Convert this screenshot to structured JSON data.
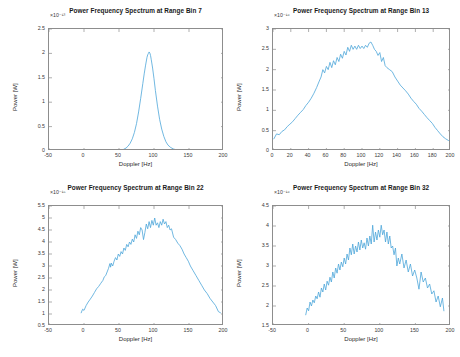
{
  "figure": {
    "background_color": "#ffffff",
    "line_color": "#4DA6D9",
    "axis_color": "#8d8d8d",
    "grid": false,
    "layout": "2x2 subplot grid"
  },
  "chart_data": [
    {
      "type": "line",
      "id": "range-bin-7",
      "title": "Power Frequency Spectrum at Range Bin 7",
      "xlabel": "Doppler [Hz]",
      "ylabel": "Power [W]",
      "exponent_label": "×10⁻¹³",
      "xlim": [
        -50,
        200
      ],
      "ylim": [
        0,
        2.5
      ],
      "xticks": [
        -50,
        0,
        50,
        100,
        150,
        200
      ],
      "xticklabels": [
        "-50",
        "0",
        "50",
        "100",
        "150",
        "200"
      ],
      "yticks": [
        0,
        0.5,
        1,
        1.5,
        2,
        2.5
      ],
      "yticklabels": [
        "0",
        "0.5",
        "1",
        "1.5",
        "2",
        "2.5"
      ],
      "legend": null,
      "series": [
        {
          "name": "spectrum",
          "color": "#4DA6D9",
          "x": [
            -48,
            -40,
            -30,
            -20,
            -10,
            0,
            10,
            20,
            30,
            40,
            48,
            52,
            56,
            60,
            63,
            66,
            69,
            72,
            75,
            78,
            81,
            84,
            86,
            88,
            90,
            91,
            92,
            93,
            94,
            95,
            96,
            98,
            100,
            102,
            105,
            108,
            111,
            114,
            117,
            120,
            124,
            128,
            133,
            138,
            145,
            152,
            160,
            170,
            180,
            190,
            198
          ],
          "y": [
            0.005,
            0.005,
            0.005,
            0.006,
            0.006,
            0.006,
            0.007,
            0.007,
            0.008,
            0.009,
            0.012,
            0.018,
            0.03,
            0.06,
            0.1,
            0.16,
            0.25,
            0.38,
            0.56,
            0.8,
            1.08,
            1.38,
            1.58,
            1.76,
            1.92,
            1.97,
            2.0,
            2.03,
            2.01,
            1.96,
            1.88,
            1.7,
            1.48,
            1.24,
            0.92,
            0.65,
            0.45,
            0.3,
            0.19,
            0.12,
            0.07,
            0.04,
            0.02,
            0.013,
            0.008,
            0.006,
            0.005,
            0.005,
            0.005,
            0.005,
            0.005
          ]
        }
      ]
    },
    {
      "type": "line",
      "id": "range-bin-13",
      "title": "Power Frequency Spectrum at Range Bin 13",
      "xlabel": "Doppler [Hz]",
      "ylabel": "Power [W]",
      "exponent_label": "×10⁻¹⁶",
      "xlim": [
        0,
        200
      ],
      "ylim": [
        0,
        3
      ],
      "xticks": [
        0,
        20,
        40,
        60,
        80,
        100,
        120,
        140,
        160,
        180,
        200
      ],
      "xticklabels": [
        "0",
        "20",
        "40",
        "60",
        "80",
        "100",
        "120",
        "140",
        "160",
        "180",
        "200"
      ],
      "yticks": [
        0,
        0.5,
        1,
        1.5,
        2,
        2.5,
        3
      ],
      "yticklabels": [
        "0",
        "0.5",
        "1",
        "1.5",
        "2",
        "2.5",
        "3"
      ],
      "legend": null,
      "series": [
        {
          "name": "spectrum",
          "color": "#4DA6D9",
          "x": [
            1,
            4,
            7,
            10,
            13,
            16,
            19,
            22,
            25,
            28,
            31,
            34,
            37,
            40,
            43,
            46,
            49,
            52,
            54,
            56,
            58,
            60,
            62,
            64,
            66,
            68,
            70,
            72,
            74,
            76,
            78,
            80,
            82,
            84,
            86,
            88,
            90,
            92,
            94,
            96,
            98,
            100,
            102,
            104,
            106,
            108,
            110,
            112,
            114,
            116,
            118,
            120,
            122,
            124,
            126,
            128,
            131,
            134,
            137,
            140,
            143,
            146,
            149,
            152,
            155,
            158,
            161,
            164,
            167,
            170,
            173,
            176,
            179,
            182,
            185,
            188,
            191,
            194,
            197,
            199
          ],
          "y": [
            0.3,
            0.42,
            0.4,
            0.48,
            0.52,
            0.6,
            0.66,
            0.72,
            0.8,
            0.88,
            0.95,
            1.02,
            1.12,
            1.2,
            1.3,
            1.42,
            1.56,
            1.72,
            1.82,
            2.0,
            1.92,
            2.08,
            2.0,
            2.18,
            2.05,
            2.22,
            2.12,
            2.3,
            2.2,
            2.38,
            2.28,
            2.45,
            2.36,
            2.55,
            2.45,
            2.6,
            2.5,
            2.58,
            2.5,
            2.6,
            2.52,
            2.58,
            2.52,
            2.6,
            2.55,
            2.65,
            2.68,
            2.6,
            2.5,
            2.45,
            2.35,
            2.42,
            2.2,
            2.3,
            2.1,
            2.05,
            2.0,
            1.95,
            1.82,
            1.72,
            1.62,
            1.55,
            1.48,
            1.4,
            1.3,
            1.22,
            1.15,
            1.05,
            0.98,
            0.9,
            0.82,
            0.75,
            0.68,
            0.58,
            0.5,
            0.42,
            0.35,
            0.3,
            0.26,
            0.24
          ]
        }
      ]
    },
    {
      "type": "line",
      "id": "range-bin-22",
      "title": "Power Frequency Spectrum at Range Bin 22",
      "xlabel": "Doppler [Hz]",
      "ylabel": "Power [W]",
      "exponent_label": "×10⁻¹⁵",
      "xlim": [
        -50,
        200
      ],
      "ylim": [
        0.5,
        5.5
      ],
      "xticks": [
        -50,
        0,
        50,
        100,
        150,
        200
      ],
      "xticklabels": [
        "-50",
        "0",
        "50",
        "100",
        "150",
        "200"
      ],
      "yticks": [
        0.5,
        1,
        1.5,
        2,
        2.5,
        3,
        3.5,
        4,
        4.5,
        5,
        5.5
      ],
      "yticklabels": [
        "0.5",
        "1",
        "1.5",
        "2",
        "2.5",
        "3",
        "3.5",
        "4",
        "4.5",
        "5",
        "5.5"
      ],
      "legend": null,
      "series": [
        {
          "name": "spectrum",
          "color": "#4DA6D9",
          "x": [
            -4,
            -2,
            0,
            3,
            6,
            9,
            12,
            15,
            18,
            21,
            24,
            27,
            29,
            31,
            33,
            35,
            37,
            38,
            39,
            41,
            43,
            45,
            47,
            49,
            51,
            53,
            55,
            57,
            59,
            61,
            63,
            65,
            67,
            69,
            71,
            73,
            75,
            77,
            79,
            81,
            83,
            85,
            87,
            89,
            91,
            93,
            95,
            97,
            99,
            101,
            103,
            105,
            107,
            109,
            111,
            113,
            115,
            117,
            119,
            121,
            123,
            125,
            128,
            131,
            134,
            137,
            140,
            143,
            146,
            149,
            152,
            156,
            160,
            164,
            168,
            172,
            176,
            180,
            184,
            188,
            192,
            195
          ],
          "y": [
            1.05,
            1.2,
            1.15,
            1.35,
            1.5,
            1.62,
            1.75,
            1.9,
            2.05,
            2.15,
            2.28,
            2.4,
            2.55,
            2.6,
            2.75,
            2.9,
            3.1,
            2.95,
            3.12,
            3.0,
            3.2,
            3.35,
            3.25,
            3.5,
            3.4,
            3.6,
            3.5,
            3.75,
            3.65,
            3.9,
            3.8,
            4.0,
            3.9,
            4.12,
            4.0,
            4.3,
            4.15,
            4.45,
            4.3,
            4.6,
            4.5,
            4.1,
            4.4,
            4.75,
            4.55,
            4.85,
            4.6,
            4.9,
            4.7,
            5.0,
            4.7,
            4.8,
            4.6,
            4.85,
            4.7,
            4.95,
            4.75,
            4.85,
            4.6,
            4.7,
            4.5,
            4.55,
            4.2,
            4.1,
            3.95,
            3.85,
            3.7,
            3.5,
            3.35,
            3.2,
            3.0,
            2.8,
            2.6,
            2.4,
            2.2,
            2.0,
            1.85,
            1.65,
            1.5,
            1.35,
            1.1,
            1.05
          ]
        }
      ]
    },
    {
      "type": "line",
      "id": "range-bin-32",
      "title": "Power Frequency Spectrum at Range Bin 32",
      "xlabel": "Doppler [Hz]",
      "ylabel": "Power [W]",
      "exponent_label": "×10⁻¹⁶",
      "xlim": [
        -50,
        200
      ],
      "ylim": [
        1.5,
        4.5
      ],
      "xticks": [
        -50,
        0,
        50,
        100,
        150,
        200
      ],
      "xticklabels": [
        "-50",
        "0",
        "50",
        "100",
        "150",
        "200"
      ],
      "yticks": [
        1.5,
        2,
        2.5,
        3,
        3.5,
        4,
        4.5
      ],
      "yticklabels": [
        "1.5",
        "2",
        "2.5",
        "3",
        "3.5",
        "4",
        "4.5"
      ],
      "legend": null,
      "series": [
        {
          "name": "spectrum",
          "color": "#4DA6D9",
          "x": [
            -4,
            -2,
            0,
            2,
            4,
            6,
            8,
            10,
            12,
            14,
            16,
            18,
            20,
            22,
            24,
            26,
            28,
            30,
            32,
            34,
            36,
            38,
            40,
            42,
            44,
            46,
            48,
            50,
            52,
            54,
            56,
            58,
            60,
            62,
            64,
            66,
            68,
            70,
            72,
            74,
            76,
            78,
            80,
            82,
            84,
            86,
            88,
            90,
            92,
            94,
            96,
            98,
            100,
            102,
            104,
            106,
            108,
            110,
            112,
            114,
            116,
            118,
            120,
            122,
            124,
            126,
            128,
            131,
            134,
            137,
            140,
            143,
            146,
            149,
            152,
            155,
            158,
            161,
            164,
            167,
            170,
            173,
            176,
            179,
            182,
            185,
            188,
            190
          ],
          "y": [
            1.78,
            1.95,
            1.88,
            2.1,
            2.0,
            2.15,
            2.08,
            2.25,
            2.18,
            2.35,
            2.22,
            2.45,
            2.35,
            2.55,
            2.4,
            2.62,
            2.52,
            2.72,
            2.6,
            2.85,
            2.7,
            2.95,
            2.82,
            3.05,
            2.9,
            3.1,
            2.98,
            3.2,
            3.05,
            3.3,
            3.15,
            3.45,
            3.28,
            3.55,
            3.3,
            3.5,
            3.35,
            3.6,
            3.4,
            3.65,
            3.45,
            3.58,
            3.42,
            3.7,
            3.5,
            3.75,
            3.55,
            4.02,
            3.6,
            3.85,
            3.65,
            3.9,
            3.72,
            4.02,
            3.78,
            3.9,
            3.6,
            3.85,
            3.55,
            3.75,
            3.45,
            3.5,
            3.28,
            3.45,
            3.0,
            3.2,
            3.05,
            3.3,
            2.95,
            3.15,
            2.85,
            3.05,
            2.75,
            2.9,
            2.7,
            2.42,
            2.85,
            2.6,
            2.7,
            2.45,
            2.55,
            2.3,
            2.38,
            2.1,
            2.25,
            1.98,
            2.2,
            1.88
          ]
        }
      ]
    }
  ]
}
